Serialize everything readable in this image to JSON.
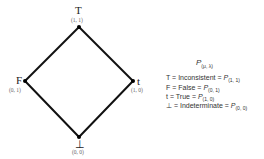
{
  "diagram": {
    "type": "lattice",
    "edge_color": "#111111",
    "vertices": {
      "top": {
        "symbol": "T",
        "coord": "(1, 1)"
      },
      "left": {
        "symbol": "F",
        "coord": "(0, 1)"
      },
      "right": {
        "symbol": "t",
        "coord": "(1, 0)"
      },
      "bottom": {
        "symbol": "⊥",
        "coord": "(0, 0)"
      }
    },
    "edges": [
      [
        "top",
        "left"
      ],
      [
        "top",
        "right"
      ],
      [
        "left",
        "bottom"
      ],
      [
        "right",
        "bottom"
      ]
    ]
  },
  "legend": {
    "title_p": "P",
    "title_sub": "(μ, λ)",
    "rows": [
      {
        "symbol": "T",
        "eq": "= Inconsistent =",
        "p": "P",
        "sub": "(1, 1)"
      },
      {
        "symbol": "F",
        "eq": "= False =",
        "p": "P",
        "sub": "(0, 1)"
      },
      {
        "symbol": "t",
        "eq": "= True =",
        "p": "P",
        "sub": "(1, 0)"
      },
      {
        "symbol": "⊥",
        "eq": "= Indeterminate =",
        "p": "P",
        "sub": "(0, 0)"
      }
    ]
  }
}
